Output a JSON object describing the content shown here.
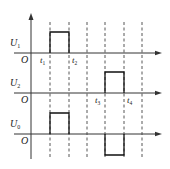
{
  "diagram": {
    "type": "timing-diagram",
    "origin_label": "O",
    "time_markers": [
      {
        "id": "t1",
        "label": "t",
        "sub": "1",
        "index": 1
      },
      {
        "id": "t2",
        "label": "t",
        "sub": "2",
        "index": 2
      },
      {
        "id": "t3",
        "label": "t",
        "sub": "3",
        "index": 4
      },
      {
        "id": "t4",
        "label": "t",
        "sub": "4",
        "index": 5
      }
    ],
    "dashed_line_count": 6,
    "signals": [
      {
        "name": "U1",
        "label": "U",
        "sub": "1",
        "pulses": [
          {
            "from": 1,
            "to": 2,
            "level": 1
          }
        ],
        "show_origin": true
      },
      {
        "name": "U2",
        "label": "U",
        "sub": "2",
        "pulses": [
          {
            "from": 4,
            "to": 5,
            "level": 1
          }
        ],
        "show_origin": true
      },
      {
        "name": "U0",
        "label": "U",
        "sub": "0",
        "pulses": [
          {
            "from": 1,
            "to": 2,
            "level": 1
          },
          {
            "from": 4,
            "to": 5,
            "level": -1
          }
        ],
        "show_origin": true
      }
    ],
    "colors": {
      "line": "#111111",
      "axis": "#333333",
      "background": "#ffffff"
    }
  }
}
